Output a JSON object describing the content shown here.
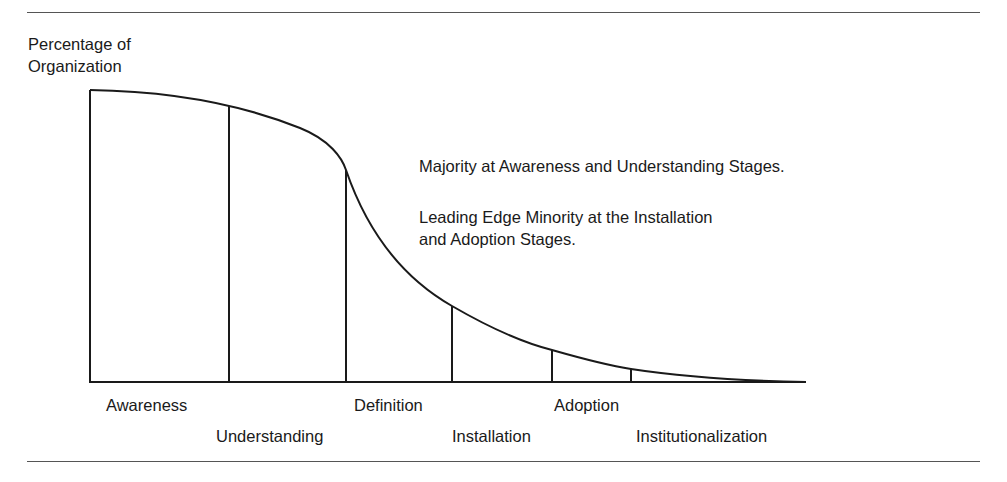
{
  "figure": {
    "y_axis_label_line1": "Percentage of",
    "y_axis_label_line2": "Organization",
    "note1": "Majority at Awareness and Understanding Stages.",
    "note2_line1": "Leading Edge Minority at the Installation",
    "note2_line2": "and Adoption Stages.",
    "stages": [
      {
        "label": "Awareness"
      },
      {
        "label": "Understanding"
      },
      {
        "label": "Definition"
      },
      {
        "label": "Installation"
      },
      {
        "label": "Adoption"
      },
      {
        "label": "Institutionalization"
      }
    ],
    "colors": {
      "line": "#1a1a1a",
      "rule": "#555555"
    }
  }
}
